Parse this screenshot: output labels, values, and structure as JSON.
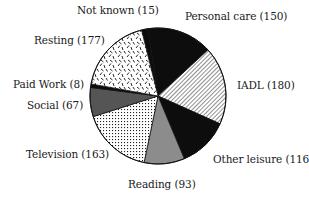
{
  "chart_data": {
    "type": "pie",
    "title": "",
    "direction": "clockwise",
    "start": "top",
    "slices": [
      {
        "label": "Not known",
        "value": 15,
        "fill": "black"
      },
      {
        "label": "Personal care",
        "value": 150,
        "fill": "black"
      },
      {
        "label": "IADL",
        "value": 180,
        "fill": "diagonal-hatch"
      },
      {
        "label": "Other leisure",
        "value": 116,
        "fill": "black"
      },
      {
        "label": "Reading",
        "value": 93,
        "fill": "grey"
      },
      {
        "label": "Television",
        "value": 163,
        "fill": "dotted"
      },
      {
        "label": "Social",
        "value": 67,
        "fill": "dark-grey"
      },
      {
        "label": "Paid Work",
        "value": 8,
        "fill": "black"
      },
      {
        "label": "Resting",
        "value": 177,
        "fill": "dashes"
      }
    ],
    "total": 969,
    "legend": "none (slice labels outside)"
  },
  "labels": {
    "not_known": "Not known (15)",
    "personal_care": "Personal care (150)",
    "iadl": "IADL (180)",
    "other_leisure": "Other leisure (116)",
    "reading": "Reading (93)",
    "television": "Television (163)",
    "social": "Social (67)",
    "paid_work": "Paid Work (8)",
    "resting": "Resting (177)"
  }
}
